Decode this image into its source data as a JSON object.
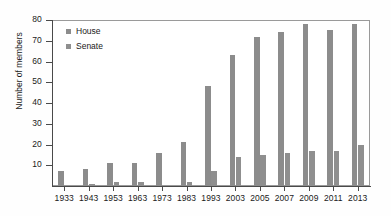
{
  "chart_data": {
    "type": "bar",
    "title": "",
    "xlabel": "",
    "ylabel": "Number of members",
    "ylim": [
      0,
      80
    ],
    "ytick_values": [
      10,
      20,
      30,
      40,
      50,
      60,
      70,
      80
    ],
    "ytick_labels": [
      "10",
      "20",
      "30",
      "40",
      "50",
      "60",
      "70",
      "80"
    ],
    "grid": false,
    "legend_position": "top-left",
    "categories": [
      "1933",
      "1943",
      "1953",
      "1963",
      "1973",
      "1983",
      "1993",
      "2003",
      "2005",
      "2007",
      "2009",
      "2011",
      "2013"
    ],
    "series": [
      {
        "name": "House",
        "color": "#8c8c8c",
        "values": [
          7,
          8,
          11,
          11,
          16,
          21,
          48,
          63,
          72,
          74,
          78,
          75,
          78
        ]
      },
      {
        "name": "Senate",
        "color": "#8f8f8f",
        "values": [
          0,
          1,
          2,
          2,
          0,
          2,
          7,
          14,
          15,
          16,
          17,
          17,
          20
        ]
      }
    ]
  },
  "legend": {
    "entries": [
      {
        "label": "House",
        "color": "#8c8c8c"
      },
      {
        "label": "Senate",
        "color": "#8f8f8f"
      }
    ]
  }
}
